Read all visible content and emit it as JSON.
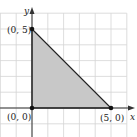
{
  "diagram": {
    "type": "coordinate-plane-region",
    "axes": {
      "x_label": "x",
      "y_label": "y"
    },
    "unit_px": 15.8,
    "origin_px": [
      32,
      108
    ],
    "grid": {
      "x_min": -2,
      "x_max": 6,
      "y_min": -1,
      "y_max": 6
    },
    "vertices": [
      {
        "label": "(0, 5)",
        "x": 0,
        "y": 5
      },
      {
        "label": "(0, 0)",
        "x": 0,
        "y": 0
      },
      {
        "label": "(5, 0)",
        "x": 5,
        "y": 0
      }
    ],
    "colors": {
      "fill": "#c8c8c8",
      "grid": "#d4d4d4",
      "edge": "#222222",
      "axis": "#333333"
    }
  }
}
